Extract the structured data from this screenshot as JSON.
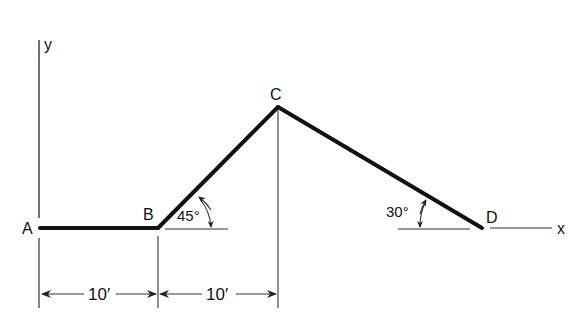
{
  "diagram": {
    "type": "structural-frame-geometry",
    "axes": {
      "x_label": "x",
      "y_label": "y"
    },
    "points": [
      {
        "id": "A",
        "label": "A"
      },
      {
        "id": "B",
        "label": "B"
      },
      {
        "id": "C",
        "label": "C"
      },
      {
        "id": "D",
        "label": "D"
      }
    ],
    "segments": [
      {
        "from": "A",
        "to": "B",
        "orientation": "horizontal"
      },
      {
        "from": "B",
        "to": "C",
        "angle_deg": 45
      },
      {
        "from": "C",
        "to": "D",
        "angle_deg": 30
      }
    ],
    "angles": {
      "at_B": "45°",
      "at_D": "30°"
    },
    "dimensions": [
      {
        "from": "A",
        "to": "B",
        "label": "10′"
      },
      {
        "from": "B",
        "to": "C",
        "label": "10′"
      }
    ]
  }
}
